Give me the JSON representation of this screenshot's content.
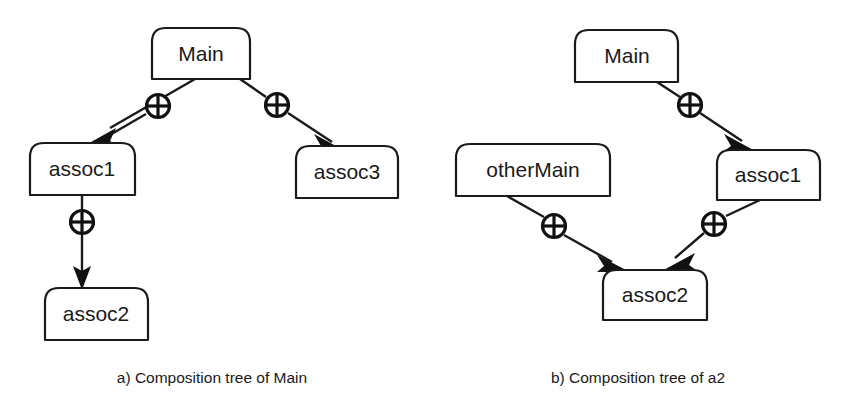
{
  "figure": {
    "background_color": "#ffffff",
    "stroke_color": "#1a1a1a",
    "panels": [
      {
        "id": "panel-a",
        "caption": "a) Composition tree of Main",
        "caption_x": 212,
        "caption_y": 379,
        "nodes": [
          {
            "id": "a-main",
            "label": "Main",
            "x": 152,
            "y": 28,
            "w": 98,
            "h": 51
          },
          {
            "id": "a-assoc1",
            "label": "assoc1",
            "x": 30,
            "y": 143,
            "w": 105,
            "h": 52
          },
          {
            "id": "a-assoc3",
            "label": "assoc3",
            "x": 296,
            "y": 146,
            "w": 102,
            "h": 52
          },
          {
            "id": "a-assoc2",
            "label": "assoc2",
            "x": 45,
            "y": 288,
            "w": 103,
            "h": 52
          }
        ],
        "edges": [
          {
            "id": "a-edge-main-assoc1",
            "from": "a-main",
            "to": "a-assoc1",
            "kind": "composition",
            "x1": 195,
            "y1": 79,
            "x2": 84,
            "y2": 143,
            "mark_x": 158,
            "mark_y": 106
          },
          {
            "id": "a-edge-main-assoc3",
            "from": "a-main",
            "to": "a-assoc3",
            "kind": "composition",
            "x1": 240,
            "y1": 79,
            "x2": 344,
            "y2": 146,
            "mark_x": 276,
            "mark_y": 106
          },
          {
            "id": "a-edge-assoc1-assoc2",
            "from": "a-assoc1",
            "to": "a-assoc2",
            "kind": "composition",
            "x1": 82,
            "y1": 195,
            "x2": 82,
            "y2": 288,
            "mark_x": 82,
            "mark_y": 222
          }
        ]
      },
      {
        "id": "panel-b",
        "caption": "b) Composition tree of a2",
        "caption_x": 638,
        "caption_y": 379,
        "nodes": [
          {
            "id": "b-main",
            "label": "Main",
            "x": 575,
            "y": 30,
            "w": 103,
            "h": 52
          },
          {
            "id": "b-otherMain",
            "label": "otherMain",
            "x": 456,
            "y": 144,
            "w": 154,
            "h": 52
          },
          {
            "id": "b-assoc1",
            "label": "assoc1",
            "x": 717,
            "y": 150,
            "w": 103,
            "h": 50
          },
          {
            "id": "b-assoc2",
            "label": "assoc2",
            "x": 603,
            "y": 270,
            "w": 104,
            "h": 50
          }
        ],
        "edges": [
          {
            "id": "b-edge-main-assoc1",
            "from": "b-main",
            "to": "b-assoc1",
            "kind": "composition",
            "x1": 657,
            "y1": 82,
            "x2": 752,
            "y2": 150,
            "mark_x": 690,
            "mark_y": 105
          },
          {
            "id": "b-edge-otherMain-assoc2",
            "from": "b-otherMain",
            "to": "b-assoc2",
            "kind": "composition",
            "x1": 507,
            "y1": 196,
            "x2": 637,
            "y2": 271,
            "mark_x": 554,
            "mark_y": 226
          },
          {
            "id": "b-edge-assoc1-assoc2",
            "from": "b-assoc1",
            "to": "b-assoc2",
            "kind": "composition",
            "x1": 760,
            "y1": 200,
            "x2": 673,
            "y2": 271,
            "mark_x": 714,
            "mark_y": 224
          }
        ]
      }
    ],
    "legend": {
      "composition_marker": "composition-plus-icon",
      "arrow_marker": "filled-arrow-head"
    }
  }
}
